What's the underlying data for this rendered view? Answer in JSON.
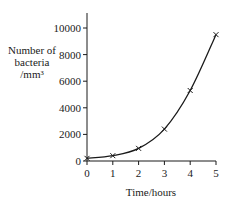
{
  "chart_data": {
    "type": "line",
    "title": "",
    "xlabel": "Time/hours",
    "ylabel": [
      "Number of",
      "bacteria",
      "/mm³"
    ],
    "x": [
      0,
      1,
      2,
      3,
      4,
      5
    ],
    "series": [
      {
        "name": "Number of bacteria",
        "values": [
          200,
          400,
          950,
          2400,
          5300,
          9500
        ],
        "marker": "x",
        "smooth_curve": true
      }
    ],
    "xlim": [
      0,
      5
    ],
    "ylim": [
      0,
      11000
    ],
    "x_ticks": [
      "0",
      "1",
      "2",
      "3",
      "4",
      "5"
    ],
    "y_ticks": [
      "0",
      "2000",
      "4000",
      "6000",
      "8000",
      "10000"
    ],
    "grid": false,
    "legend": null
  },
  "colors": {
    "line": "#1a1a1a",
    "background": "#ffffff"
  }
}
